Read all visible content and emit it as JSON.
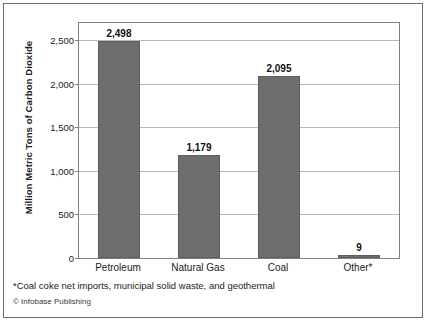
{
  "chart_data": {
    "type": "bar",
    "title": "",
    "xlabel": "",
    "ylabel": "Million Metric Tons of Carbon Dioxide",
    "categories": [
      "Petroleum",
      "Natural Gas",
      "Coal",
      "Other*"
    ],
    "values": [
      2498,
      1179,
      2095,
      9
    ],
    "value_labels": [
      "2,498",
      "1,179",
      "2,095",
      "9"
    ],
    "ylim": [
      0,
      2700
    ],
    "yticks": [
      0,
      500,
      1000,
      1500,
      2000,
      2500
    ],
    "ytick_labels": [
      "0",
      "500",
      "1,000",
      "1,500",
      "2,000",
      "2,500"
    ],
    "grid": true,
    "legend": "none",
    "bar_color": "#6e6e6e",
    "gridline_color": "#b9b9b9",
    "axis_color": "#808080",
    "frame_color": "#6d6d6d"
  },
  "footnote": "*Coal coke net imports, municipal solid waste, and geothermal",
  "copyright": "© Infobase Publishing"
}
